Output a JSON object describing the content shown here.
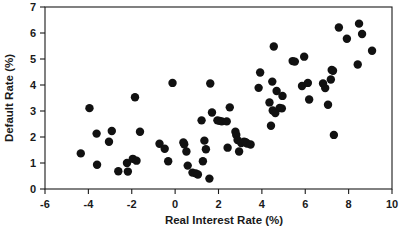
{
  "chart_data": {
    "type": "scatter",
    "title": "",
    "xlabel": "Real Interest Rate (%)",
    "ylabel": "Default Rate (%)",
    "xlim": [
      -6,
      10
    ],
    "ylim": [
      0,
      7
    ],
    "xticks": [
      -6,
      -4,
      -2,
      0,
      2,
      4,
      6,
      8,
      10
    ],
    "yticks": [
      0,
      1,
      2,
      3,
      4,
      5,
      6,
      7
    ],
    "xtick_labels": [
      "-6",
      "-4",
      "-2",
      "0",
      "2",
      "4",
      "6",
      "8",
      "10"
    ],
    "ytick_labels": [
      "0",
      "1",
      "2",
      "3",
      "4",
      "5",
      "6",
      "7"
    ],
    "grid": false,
    "legend": null,
    "marker": "filled-circle",
    "marker_color": "#111111",
    "marker_size": 4.2,
    "n_points": 92,
    "points": [
      [
        -4.35,
        1.37
      ],
      [
        -3.95,
        3.11
      ],
      [
        -3.62,
        2.13
      ],
      [
        -3.6,
        0.93
      ],
      [
        -3.05,
        1.82
      ],
      [
        -2.92,
        2.23
      ],
      [
        -2.62,
        0.68
      ],
      [
        -2.22,
        1.0
      ],
      [
        -2.18,
        0.67
      ],
      [
        -1.95,
        1.16
      ],
      [
        -1.85,
        3.53
      ],
      [
        -1.78,
        1.09
      ],
      [
        -1.62,
        2.2
      ],
      [
        -0.72,
        1.74
      ],
      [
        -0.48,
        1.55
      ],
      [
        -0.32,
        1.07
      ],
      [
        -0.12,
        4.08
      ],
      [
        0.38,
        1.79
      ],
      [
        0.42,
        1.72
      ],
      [
        0.52,
        1.44
      ],
      [
        0.58,
        0.9
      ],
      [
        0.8,
        0.63
      ],
      [
        0.95,
        0.6
      ],
      [
        1.05,
        0.56
      ],
      [
        1.22,
        2.64
      ],
      [
        1.28,
        1.07
      ],
      [
        1.35,
        1.86
      ],
      [
        1.42,
        1.53
      ],
      [
        1.58,
        0.4
      ],
      [
        1.62,
        4.06
      ],
      [
        1.7,
        2.94
      ],
      [
        1.95,
        2.64
      ],
      [
        2.05,
        2.62
      ],
      [
        2.15,
        2.6
      ],
      [
        2.38,
        2.6
      ],
      [
        2.42,
        1.59
      ],
      [
        2.52,
        3.14
      ],
      [
        2.78,
        2.2
      ],
      [
        2.82,
        2.08
      ],
      [
        2.88,
        1.88
      ],
      [
        2.95,
        1.44
      ],
      [
        3.05,
        1.77
      ],
      [
        3.18,
        1.82
      ],
      [
        3.25,
        1.8
      ],
      [
        3.32,
        1.75
      ],
      [
        3.48,
        1.71
      ],
      [
        3.85,
        3.89
      ],
      [
        3.92,
        4.48
      ],
      [
        4.35,
        3.33
      ],
      [
        4.42,
        2.43
      ],
      [
        4.48,
        4.13
      ],
      [
        4.5,
        3.02
      ],
      [
        4.55,
        5.48
      ],
      [
        4.62,
        2.92
      ],
      [
        4.68,
        3.77
      ],
      [
        4.82,
        3.12
      ],
      [
        4.92,
        3.1
      ],
      [
        4.95,
        3.58
      ],
      [
        5.42,
        4.92
      ],
      [
        5.52,
        4.9
      ],
      [
        5.85,
        3.96
      ],
      [
        5.95,
        5.09
      ],
      [
        6.12,
        4.08
      ],
      [
        6.18,
        3.44
      ],
      [
        6.82,
        4.06
      ],
      [
        6.92,
        3.88
      ],
      [
        7.05,
        3.24
      ],
      [
        7.18,
        4.21
      ],
      [
        7.22,
        4.58
      ],
      [
        7.28,
        4.55
      ],
      [
        7.32,
        2.08
      ],
      [
        7.55,
        6.21
      ],
      [
        7.92,
        5.78
      ],
      [
        8.42,
        4.79
      ],
      [
        8.48,
        6.36
      ],
      [
        8.62,
        5.96
      ],
      [
        9.08,
        5.32
      ]
    ]
  },
  "figure": {
    "background_color": "#ffffff",
    "axis_color": "#1a1a1a",
    "point_color": "#111111"
  }
}
